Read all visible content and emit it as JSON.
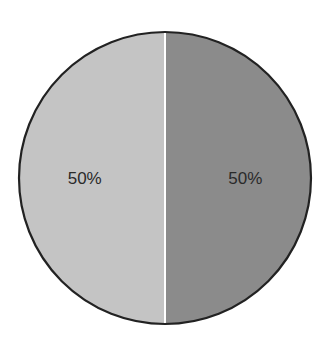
{
  "chart_data": {
    "type": "pie",
    "title": "",
    "categories": [
      "Slice A",
      "Slice B"
    ],
    "values": [
      50,
      50
    ],
    "labels": [
      "50%",
      "50%"
    ],
    "colors": [
      "#c4c4c4",
      "#8b8b8b"
    ],
    "outline_color": "#222222",
    "divider_color": "#ffffff",
    "legend": null,
    "start_angle_deg": 90,
    "direction": "left slice first (counter-clockwise from top)"
  }
}
